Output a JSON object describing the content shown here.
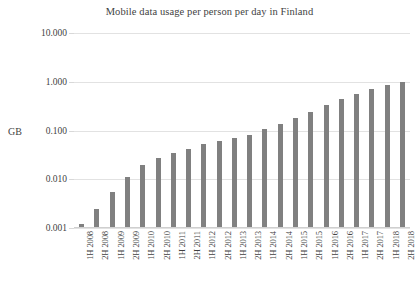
{
  "chart_data": {
    "type": "bar",
    "title": "Mobile data usage per person per day in Finland",
    "xlabel": "",
    "ylabel": "GB",
    "yscale": "log",
    "ylim": [
      0.001,
      10.0
    ],
    "ytick_labels": [
      "10.000",
      "1.000",
      "0.100",
      "0.010",
      "0.001"
    ],
    "ytick_values": [
      10.0,
      1.0,
      0.1,
      0.01,
      0.001
    ],
    "grid": true,
    "legend": false,
    "bar_color": "#808080",
    "categories": [
      "1H 2008",
      "2H 2008",
      "1H 2009",
      "2H 2009",
      "1H 2010",
      "2H 2010",
      "1H 2011",
      "2H 2011",
      "1H 2012",
      "2H 2012",
      "1H 2013",
      "2H 2013",
      "1H 2014",
      "2H 2014",
      "1H 2015",
      "2H 2015",
      "1H 2016",
      "2H 2016",
      "1H 2017",
      "2H 2017",
      "1H 2018",
      "2H 2018"
    ],
    "values": [
      0.0012,
      0.0025,
      0.0055,
      0.011,
      0.02,
      0.027,
      0.034,
      0.042,
      0.052,
      0.06,
      0.07,
      0.08,
      0.105,
      0.135,
      0.18,
      0.24,
      0.33,
      0.44,
      0.56,
      0.7,
      0.86,
      1.0
    ]
  },
  "title": {
    "text": "Mobile data usage per person per day in Finland"
  },
  "axis": {
    "y_title": "GB"
  }
}
